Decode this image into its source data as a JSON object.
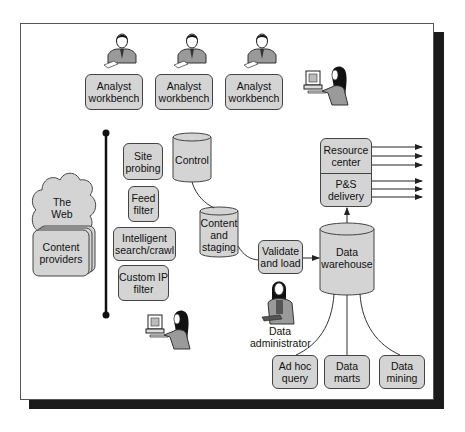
{
  "diagram": {
    "analysts": [
      {
        "label_line1": "Analyst",
        "label_line2": "workbench"
      },
      {
        "label_line1": "Analyst",
        "label_line2": "workbench"
      },
      {
        "label_line1": "Analyst",
        "label_line2": "workbench"
      }
    ],
    "web": {
      "cloud_line1": "The",
      "cloud_line2": "Web",
      "providers_line1": "Content",
      "providers_line2": "providers"
    },
    "tools": [
      {
        "line1": "Site",
        "line2": "probing"
      },
      {
        "line1": "Feed",
        "line2": "filter"
      },
      {
        "line1": "Intelligent",
        "line2": "search/crawl"
      },
      {
        "line1": "Custom IP",
        "line2": "filter"
      }
    ],
    "control": {
      "label": "Control"
    },
    "staging": {
      "line1": "Content",
      "line2": "and",
      "line3": "staging"
    },
    "validate": {
      "line1": "Validate",
      "line2": "and load"
    },
    "warehouse": {
      "line1": "Data",
      "line2": "warehouse"
    },
    "delivery": {
      "top_line1": "Resource",
      "top_line2": "center",
      "bottom_line1": "P&S",
      "bottom_line2": "delivery"
    },
    "administrator": {
      "line1": "Data",
      "line2": "administrator"
    },
    "outputs": [
      {
        "line1": "Ad hoc",
        "line2": "query"
      },
      {
        "line1": "Data",
        "line2": "marts"
      },
      {
        "line1": "Data",
        "line2": "mining"
      }
    ],
    "colors": {
      "box_fill": "#d4d4d4",
      "stroke": "#444444",
      "shadow": "#1b1b1b",
      "background": "#ffffff"
    }
  }
}
